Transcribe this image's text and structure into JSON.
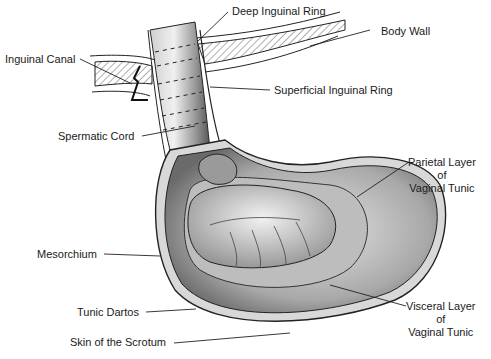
{
  "diagram": {
    "type": "anatomical-illustration",
    "style": "black-and-white stippled line drawing",
    "colors": {
      "ink": "#1a1a1a",
      "background": "#ffffff",
      "shade_dark": "#6a6a6a",
      "shade_mid": "#a8a8a8",
      "shade_light": "#d6d6d6"
    }
  },
  "labels": {
    "deep_inguinal_ring": "Deep Inguinal Ring",
    "body_wall": "Body Wall",
    "inguinal_canal": "Inguinal Canal",
    "superficial_inguinal_ring": "Superficial Inguinal Ring",
    "spermatic_cord": "Spermatic Cord",
    "parietal_layer": {
      "line1": "Parietal Layer",
      "line2": "of",
      "line3": "Vaginal Tunic"
    },
    "mesorchium": "Mesorchium",
    "tunic_dartos": "Tunic Dartos",
    "visceral_layer": {
      "line1": "Visceral Layer",
      "line2": "of",
      "line3": "Vaginal Tunic"
    },
    "skin_of_scrotum": "Skin of the Scrotum"
  }
}
